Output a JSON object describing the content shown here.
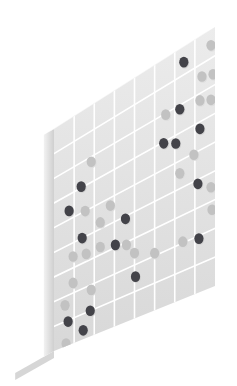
{
  "illustration": {
    "title": "Isometric perforated wall panel with dot markers",
    "subject": "grid-wall-panel",
    "background_color": "#ffffff",
    "view": "isometric-left-facing"
  },
  "panel": {
    "name": "grid-wall",
    "face_color_top": "#ececec",
    "face_color_bottom": "#d8d8d8",
    "edge_color": "#f2f2f2",
    "edge_shade_color": "#cfcfcf",
    "top_cap_color": "#f7f7f7",
    "grid_line_color": "#ffffff",
    "grid_line_width": 1.6,
    "columns": 8,
    "rows": 9,
    "thickness_px": 11
  },
  "base": {
    "name": "floor-foot",
    "top_color": "#ededed",
    "front_color": "#d6d6d6",
    "depth_px": 40
  },
  "dot_palette": {
    "dark": "#434349",
    "mid": "#9a9a9a",
    "light": "#c2c2c2",
    "pale": "#d0d0d0",
    "shadow": "#b4b4b4"
  },
  "dot_radius": 4.6,
  "chart_data": {
    "type": "scatter",
    "xlabel": "column",
    "ylabel": "row",
    "grid": true,
    "legend": null,
    "xlim": [
      0,
      8
    ],
    "ylim": [
      0,
      9
    ],
    "categories": [
      "dark",
      "light"
    ],
    "points": [
      {
        "col": 6.45,
        "row": 0.55,
        "tone": "dark"
      },
      {
        "col": 7.8,
        "row": 0.55,
        "tone": "light"
      },
      {
        "col": 7.35,
        "row": 1.45,
        "tone": "light"
      },
      {
        "col": 7.9,
        "row": 1.6,
        "tone": "light"
      },
      {
        "col": 5.55,
        "row": 2.05,
        "tone": "light"
      },
      {
        "col": 6.25,
        "row": 2.15,
        "tone": "dark"
      },
      {
        "col": 7.25,
        "row": 2.25,
        "tone": "light"
      },
      {
        "col": 7.8,
        "row": 2.45,
        "tone": "light"
      },
      {
        "col": 1.85,
        "row": 2.2,
        "tone": "light"
      },
      {
        "col": 1.35,
        "row": 2.95,
        "tone": "dark"
      },
      {
        "col": 5.45,
        "row": 3.05,
        "tone": "dark"
      },
      {
        "col": 6.05,
        "row": 3.3,
        "tone": "dark"
      },
      {
        "col": 7.25,
        "row": 3.25,
        "tone": "dark"
      },
      {
        "col": 0.75,
        "row": 3.65,
        "tone": "dark"
      },
      {
        "col": 1.55,
        "row": 4.0,
        "tone": "light"
      },
      {
        "col": 6.95,
        "row": 4.05,
        "tone": "light"
      },
      {
        "col": 2.8,
        "row": 4.3,
        "tone": "light"
      },
      {
        "col": 6.25,
        "row": 4.45,
        "tone": "light"
      },
      {
        "col": 2.3,
        "row": 4.75,
        "tone": "light"
      },
      {
        "col": 1.4,
        "row": 5.0,
        "tone": "dark"
      },
      {
        "col": 3.55,
        "row": 5.1,
        "tone": "dark"
      },
      {
        "col": 7.15,
        "row": 5.15,
        "tone": "dark"
      },
      {
        "col": 7.8,
        "row": 5.5,
        "tone": "light"
      },
      {
        "col": 0.95,
        "row": 5.55,
        "tone": "light"
      },
      {
        "col": 1.6,
        "row": 5.7,
        "tone": "light"
      },
      {
        "col": 2.3,
        "row": 5.7,
        "tone": "light"
      },
      {
        "col": 3.05,
        "row": 5.9,
        "tone": "dark"
      },
      {
        "col": 3.6,
        "row": 6.1,
        "tone": "light"
      },
      {
        "col": 7.85,
        "row": 6.3,
        "tone": "light"
      },
      {
        "col": 4.0,
        "row": 6.55,
        "tone": "light"
      },
      {
        "col": 0.95,
        "row": 6.6,
        "tone": "light"
      },
      {
        "col": 5.0,
        "row": 6.9,
        "tone": "light"
      },
      {
        "col": 6.4,
        "row": 6.95,
        "tone": "light"
      },
      {
        "col": 7.2,
        "row": 7.1,
        "tone": "dark"
      },
      {
        "col": 1.85,
        "row": 7.2,
        "tone": "light"
      },
      {
        "col": 0.55,
        "row": 7.35,
        "tone": "light"
      },
      {
        "col": 4.05,
        "row": 7.45,
        "tone": "dark"
      },
      {
        "col": 0.7,
        "row": 8.05,
        "tone": "dark"
      },
      {
        "col": 1.8,
        "row": 8.0,
        "tone": "dark"
      },
      {
        "col": 1.45,
        "row": 8.65,
        "tone": "dark"
      },
      {
        "col": 0.6,
        "row": 8.9,
        "tone": "light"
      }
    ]
  }
}
